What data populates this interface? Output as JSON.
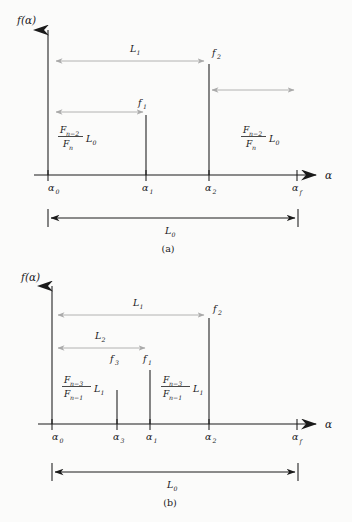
{
  "figure": {
    "caption_a": "(a)",
    "caption_b": "(b)",
    "axis_y_label": "f(α)",
    "axis_x_label": "α"
  },
  "panel_a": {
    "label": "(a)",
    "y_axis_label": "f(α)",
    "x_axis_label": "α",
    "x_ticks": [
      {
        "label": "α",
        "sub": "0",
        "x": 48
      },
      {
        "label": "α",
        "sub": "1",
        "x": 146
      },
      {
        "label": "α",
        "sub": "2",
        "x": 209
      },
      {
        "label": "α",
        "sub": "f",
        "x": 297
      }
    ],
    "stems": [
      {
        "name": "f",
        "sub": "1",
        "x": 146,
        "label": "f₁"
      },
      {
        "name": "f",
        "sub": "2",
        "x": 209,
        "label": "f₂"
      }
    ],
    "arrows": [
      {
        "name": "L1-arrow",
        "label": "L",
        "sub": "1",
        "from": 56,
        "to": 207,
        "y": 61
      },
      {
        "name": "f1-arrow",
        "label": "",
        "sub": "",
        "from": 56,
        "to": 146,
        "y": 112
      },
      {
        "name": "right-arrow",
        "label": "",
        "sub": "",
        "from": 211,
        "to": 297,
        "y": 90
      }
    ],
    "fraction_left": {
      "num": "F",
      "num_sub": "n−2",
      "den": "F",
      "den_sub": "n",
      "tail": "L",
      "tail_sub": "0"
    },
    "fraction_right": {
      "num": "F",
      "num_sub": "n−2",
      "den": "F",
      "den_sub": "n",
      "tail": "L",
      "tail_sub": "0"
    },
    "baseline_measure": {
      "label": "L",
      "sub": "0",
      "from": 48,
      "to": 298
    }
  },
  "panel_b": {
    "label": "(b)",
    "y_axis_label": "f(α)",
    "x_axis_label": "α",
    "x_ticks": [
      {
        "label": "α",
        "sub": "0",
        "x": 52
      },
      {
        "label": "α",
        "sub": "3",
        "x": 117
      },
      {
        "label": "α",
        "sub": "1",
        "x": 150
      },
      {
        "label": "α",
        "sub": "2",
        "x": 209
      },
      {
        "label": "α",
        "sub": "f",
        "x": 297
      }
    ],
    "stems": [
      {
        "name": "f",
        "sub": "3",
        "x": 117,
        "label": "f₃"
      },
      {
        "name": "f",
        "sub": "1",
        "x": 150,
        "label": "f₁"
      },
      {
        "name": "f",
        "sub": "2",
        "x": 209,
        "label": "f₂"
      }
    ],
    "arrows": [
      {
        "name": "L1-arrow",
        "label": "L",
        "sub": "1",
        "from": 58,
        "to": 207,
        "y": 315
      },
      {
        "name": "L2-arrow",
        "label": "L",
        "sub": "2",
        "from": 58,
        "to": 148,
        "y": 348
      }
    ],
    "fraction_left": {
      "num": "F",
      "num_sub": "n−3",
      "den": "F",
      "den_sub": "n−1",
      "tail": "L",
      "tail_sub": "1"
    },
    "fraction_right": {
      "num": "F",
      "num_sub": "n−3",
      "den": "F",
      "den_sub": "n−1",
      "tail": "L",
      "tail_sub": "1"
    },
    "baseline_measure": {
      "label": "L",
      "sub": "0",
      "from": 52,
      "to": 298
    }
  },
  "colors": {
    "ink": "#1a1a1a",
    "gray_arrow": "#a9a9a9",
    "background": "#fbfbfa"
  }
}
